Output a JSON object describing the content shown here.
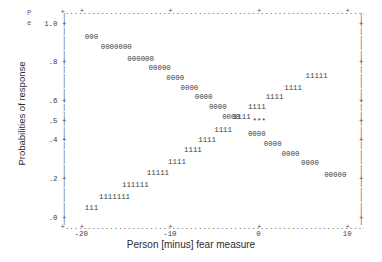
{
  "chart_data": {
    "type": "scatter",
    "title": "",
    "subtitle": "",
    "xlabel": "Person [minus] fear measure",
    "ylabel": "Probabilities of response",
    "xlim": [
      -22.0,
      11.5
    ],
    "ylim": [
      -0.02,
      1.04
    ],
    "grid": false,
    "legend_position": "none",
    "xticks": [
      "-20",
      "-10",
      "0",
      "10"
    ],
    "xtick_values": [
      -20,
      -10,
      0,
      10
    ],
    "yticks": [
      "1.0",
      ".8",
      ".6",
      ".5",
      ".4",
      ".2",
      ".0"
    ],
    "ytick_values": [
      1.0,
      0.8,
      0.6,
      0.5,
      0.4,
      0.2,
      0.0
    ],
    "corner_label_top": "P",
    "corner_label_bottom": "e",
    "annotations": [
      {
        "text": "***",
        "x": 0.0,
        "y": 0.5,
        "note": "curve crossing point"
      }
    ],
    "series": [
      {
        "name": "0",
        "symbol": "0",
        "description": "descending response curve plotted with the character 0",
        "rows": [
          {
            "y": 0.93,
            "x_start": -19.6,
            "chars": "000"
          },
          {
            "y": 0.88,
            "x_start": -17.8,
            "chars": "0000000"
          },
          {
            "y": 0.82,
            "x_start": -14.8,
            "chars": "000000"
          },
          {
            "y": 0.77,
            "x_start": -12.4,
            "chars": "00000"
          },
          {
            "y": 0.72,
            "x_start": -10.4,
            "chars": "0000"
          },
          {
            "y": 0.67,
            "x_start": -8.8,
            "chars": "0000"
          },
          {
            "y": 0.62,
            "x_start": -7.2,
            "chars": "0000"
          },
          {
            "y": 0.57,
            "x_start": -5.6,
            "chars": "0000"
          },
          {
            "y": 0.52,
            "x_start": -4.1,
            "chars": "0000"
          },
          {
            "y": 0.43,
            "x_start": -1.2,
            "chars": "0000"
          },
          {
            "y": 0.38,
            "x_start": 0.6,
            "chars": "0000"
          },
          {
            "y": 0.33,
            "x_start": 2.6,
            "chars": "0000"
          },
          {
            "y": 0.28,
            "x_start": 4.8,
            "chars": "0000"
          },
          {
            "y": 0.22,
            "x_start": 7.4,
            "chars": "00000"
          }
        ]
      },
      {
        "name": "1",
        "symbol": "1",
        "description": "ascending response curve plotted with the character 1",
        "rows": [
          {
            "y": 0.05,
            "x_start": -19.6,
            "chars": "111"
          },
          {
            "y": 0.11,
            "x_start": -18.0,
            "chars": "1111111"
          },
          {
            "y": 0.17,
            "x_start": -15.4,
            "chars": "111111"
          },
          {
            "y": 0.23,
            "x_start": -12.6,
            "chars": "11111"
          },
          {
            "y": 0.29,
            "x_start": -10.2,
            "chars": "1111"
          },
          {
            "y": 0.35,
            "x_start": -8.4,
            "chars": "1111"
          },
          {
            "y": 0.4,
            "x_start": -6.8,
            "chars": "1111"
          },
          {
            "y": 0.45,
            "x_start": -5.0,
            "chars": "1111"
          },
          {
            "y": 0.52,
            "x_start": -2.9,
            "chars": "1111"
          },
          {
            "y": 0.57,
            "x_start": -1.2,
            "chars": "1111"
          },
          {
            "y": 0.62,
            "x_start": 0.8,
            "chars": "1111"
          },
          {
            "y": 0.67,
            "x_start": 2.9,
            "chars": "1111"
          },
          {
            "y": 0.73,
            "x_start": 5.3,
            "chars": "11111"
          }
        ]
      }
    ]
  }
}
